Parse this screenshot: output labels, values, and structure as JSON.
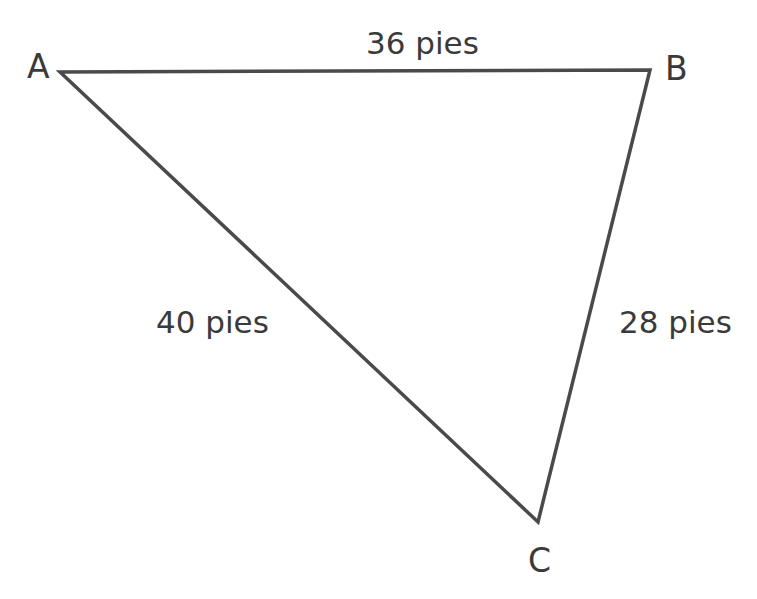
{
  "figure": {
    "type": "triangle-diagram",
    "background_color": "#ffffff",
    "stroke_color": "#4a4a4a",
    "text_color": "#3a3a3a",
    "stroke_width": 3.5,
    "unit": "pies"
  },
  "vertices": [
    {
      "name": "A",
      "label": "A",
      "x": 60,
      "y": 72
    },
    {
      "name": "B",
      "label": "B",
      "x": 650,
      "y": 70
    },
    {
      "name": "C",
      "label": "C",
      "x": 538,
      "y": 522
    }
  ],
  "sides": [
    {
      "name": "AB",
      "label": "36 pies",
      "value": 36,
      "from": "A",
      "to": "B"
    },
    {
      "name": "AC",
      "label": "40 pies",
      "value": 40,
      "from": "A",
      "to": "C"
    },
    {
      "name": "BC",
      "label": "28 pies",
      "value": 28,
      "from": "B",
      "to": "C"
    }
  ],
  "chart_data": {
    "type": "diagram",
    "title": "",
    "shape": "triangle",
    "categories": [
      "AB",
      "AC",
      "BC"
    ],
    "values": [
      36,
      40,
      28
    ],
    "value_labels": [
      "36 pies",
      "40 pies",
      "28 pies"
    ],
    "vertex_labels": [
      "A",
      "B",
      "C"
    ],
    "vertex_points": [
      [
        60,
        72
      ],
      [
        650,
        70
      ],
      [
        538,
        522
      ]
    ],
    "xlabel": "",
    "ylabel": "",
    "grid": false,
    "legend": "none"
  }
}
